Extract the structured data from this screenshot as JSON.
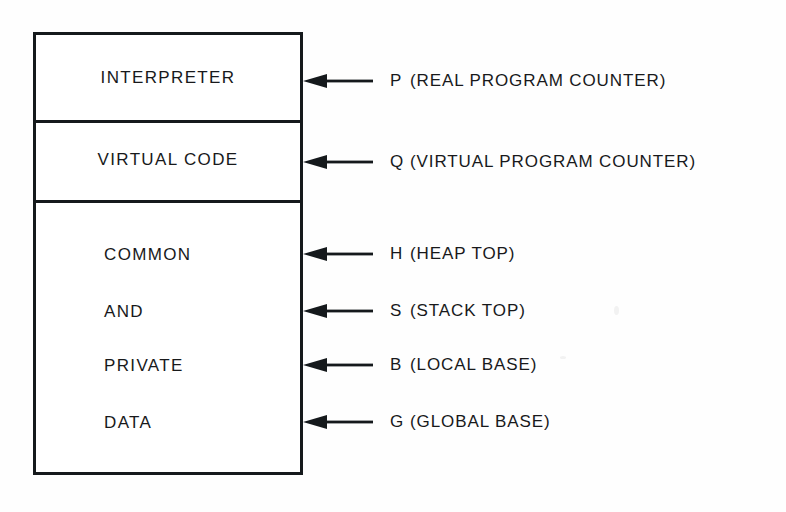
{
  "diagram": {
    "box": {
      "border_color": "#15191c",
      "fill_color": "#ffffff"
    },
    "sections": [
      {
        "id": "interpreter",
        "label": "INTERPRETER",
        "align": "center"
      },
      {
        "id": "virtual-code",
        "label": "VIRTUAL CODE",
        "align": "center"
      },
      {
        "id": "common",
        "label": "COMMON",
        "align": "left"
      },
      {
        "id": "and",
        "label": "AND",
        "align": "left"
      },
      {
        "id": "private",
        "label": "PRIVATE",
        "align": "left"
      },
      {
        "id": "data",
        "label": "DATA",
        "align": "left"
      }
    ],
    "pointers": [
      {
        "symbol": "P",
        "description": "(REAL PROGRAM COUNTER)",
        "icon": "left-arrow-icon"
      },
      {
        "symbol": "Q",
        "description": "(VIRTUAL PROGRAM COUNTER)",
        "icon": "left-arrow-icon"
      },
      {
        "symbol": "H",
        "description": "(HEAP TOP)",
        "icon": "left-arrow-icon"
      },
      {
        "symbol": "S",
        "description": "(STACK TOP)",
        "icon": "left-arrow-icon"
      },
      {
        "symbol": "B",
        "description": "(LOCAL BASE)",
        "icon": "left-arrow-icon"
      },
      {
        "symbol": "G",
        "description": "(GLOBAL BASE)",
        "icon": "left-arrow-icon"
      }
    ]
  }
}
